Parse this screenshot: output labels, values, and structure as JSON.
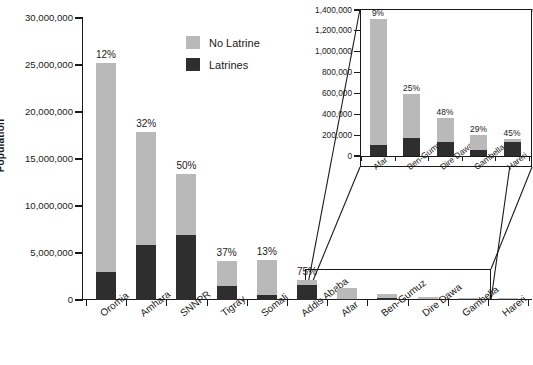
{
  "chart_data": {
    "type": "bar",
    "title": "",
    "xlabel": "",
    "ylabel": "Population",
    "ylim": [
      0,
      30000000
    ],
    "ytick_labels": [
      "30,000,000",
      "25,000,000",
      "20,000,000",
      "15,000,000",
      "10,000,000",
      "5,000,000",
      "0"
    ],
    "ytick_values": [
      30000000,
      25000000,
      20000000,
      15000000,
      10000000,
      5000000,
      0
    ],
    "grid": false,
    "stacked": true,
    "legend": {
      "position": "top-center",
      "entries": [
        {
          "label": "No Latrine",
          "color": "#b9b9b9"
        },
        {
          "label": "Latrines",
          "color": "#2e2e2e"
        }
      ]
    },
    "categories": [
      "Oromia",
      "Amhara",
      "SNNPR",
      "Tigray",
      "Somali",
      "Addis Ababa",
      "Afar",
      "Ben-Gumuz",
      "Dire Dawa",
      "Gambella",
      "Hareri"
    ],
    "series": [
      {
        "name": "Latrines",
        "values": [
          3000000,
          5800000,
          6900000,
          1450000,
          560000,
          1600000,
          105000,
          175000,
          135000,
          58000,
          130000
        ]
      },
      {
        "name": "No Latrine",
        "values": [
          22200000,
          12100000,
          6500000,
          2750000,
          3700000,
          530000,
          1205000,
          415000,
          230000,
          147000,
          30000
        ]
      }
    ],
    "totals": [
      25200000,
      17900000,
      13400000,
      4200000,
      4260000,
      2130000,
      1310000,
      590000,
      365000,
      205000,
      160000
    ],
    "data_labels": [
      "12%",
      "32%",
      "50%",
      "37%",
      "13%",
      "75%",
      "9%",
      "25%",
      "48%",
      "29%",
      "45%"
    ]
  },
  "inset_chart": {
    "type": "bar",
    "stacked": true,
    "ylim": [
      0,
      1400000
    ],
    "ytick_labels": [
      "1,400,000",
      "1,200,000",
      "1,000,000",
      "800,000",
      "600,000",
      "400,000",
      "200,000",
      "0"
    ],
    "ytick_values": [
      1400000,
      1200000,
      1000000,
      800000,
      600000,
      400000,
      200000,
      0
    ],
    "categories": [
      "Afar",
      "Ben-Gumuz",
      "Dire Dawa",
      "Gambella",
      "Hareri"
    ],
    "series": [
      {
        "name": "Latrines",
        "values": [
          105000,
          175000,
          135000,
          58000,
          130000
        ]
      },
      {
        "name": "No Latrine",
        "values": [
          1205000,
          415000,
          230000,
          147000,
          30000
        ]
      }
    ],
    "totals": [
      1310000,
      590000,
      365000,
      205000,
      160000
    ],
    "data_labels": [
      "9%",
      "25%",
      "48%",
      "29%",
      "45%"
    ]
  },
  "axis": {
    "y_title": "Population",
    "y_ticks": [
      "30,000,000",
      "25,000,000",
      "20,000,000",
      "15,000,000",
      "10,000,000",
      "5,000,000",
      "0"
    ],
    "x_ticks": [
      "Oromia",
      "Amhara",
      "SNNPR",
      "Tigray",
      "Somali",
      "Addis Ababa",
      "Afar",
      "Ben-Gumuz",
      "Dire Dawa",
      "Gambella",
      "Hareri"
    ],
    "pct_labels": [
      "12%",
      "32%",
      "50%",
      "37%",
      "13%",
      "75%",
      "9%",
      "25%",
      "48%",
      "29%",
      "45%"
    ]
  },
  "inset_axis": {
    "y_ticks": [
      "1,400,000",
      "1,200,000",
      "1,000,000",
      "800,000",
      "600,000",
      "400,000",
      "200,000",
      "0"
    ],
    "x_ticks": [
      "Afar",
      "Ben-Gumuz",
      "Dire Dawa",
      "Gambella",
      "Hareri"
    ],
    "pct_labels": [
      "9%",
      "25%",
      "48%",
      "29%",
      "45%"
    ]
  },
  "legend": {
    "no_latrine": "No Latrine",
    "latrines": "Latrines"
  },
  "colors": {
    "no_latrine": "#b9b9b9",
    "latrines": "#2e2e2e",
    "axis": "#1a1a1a",
    "background": "#ffffff"
  }
}
